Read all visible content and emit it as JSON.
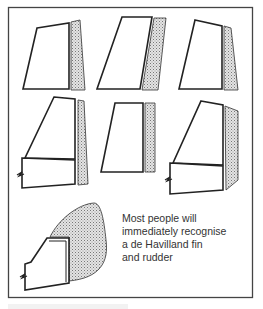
{
  "figure": {
    "panels": [
      {
        "id": "tail-1",
        "row": 1,
        "col": 1,
        "has_fuselage_stub": false
      },
      {
        "id": "tail-2",
        "row": 1,
        "col": 2,
        "has_fuselage_stub": false
      },
      {
        "id": "tail-3",
        "row": 1,
        "col": 3,
        "has_fuselage_stub": false
      },
      {
        "id": "tail-4",
        "row": 2,
        "col": 1,
        "has_fuselage_stub": true
      },
      {
        "id": "tail-5",
        "row": 2,
        "col": 2,
        "has_fuselage_stub": false
      },
      {
        "id": "tail-6",
        "row": 2,
        "col": 3,
        "has_fuselage_stub": true
      },
      {
        "id": "tail-7",
        "row": 3,
        "col": 1,
        "has_fuselage_stub": true
      }
    ],
    "annotation": {
      "lines": [
        "Most people will",
        "immediately  recognise",
        "a de Havilland fin",
        "and rudder"
      ]
    },
    "colors": {
      "outline": "#222222",
      "rudder_fill": "#c8c8c8",
      "frame": "#444444"
    }
  }
}
